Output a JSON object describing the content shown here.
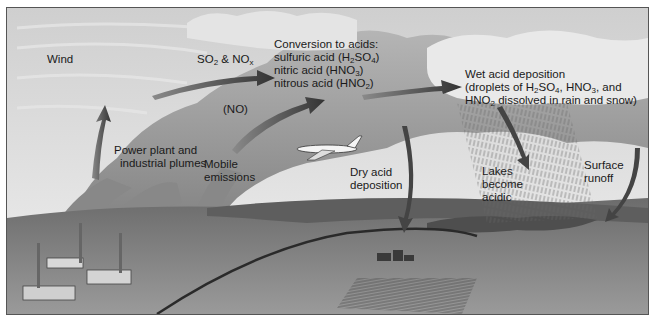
{
  "diagram": {
    "title": "Acid deposition",
    "colors": {
      "sky": "#d9d9d9",
      "cloud_light": "#e8e8e8",
      "cloud_dark": "#8a8a8a",
      "ground": "#7a7a7a",
      "arrow": "#444444",
      "text": "#1a1a1a"
    },
    "labels": {
      "wind": "Wind",
      "so2_nox": {
        "a": "SO",
        "a_sub": "2",
        "b": " & NO",
        "b_sub": "x"
      },
      "conversion": {
        "title": "Conversion to acids:",
        "line1": {
          "pre": "sulfuric acid (H",
          "s1": "2",
          "mid": "SO",
          "s2": "4",
          "post": ")"
        },
        "line2": {
          "pre": "nitric acid (HNO",
          "s1": "3",
          "post": ")"
        },
        "line3": {
          "pre": "nitrous acid (HNO",
          "s1": "2",
          "post": ")"
        }
      },
      "wet": {
        "title": "Wet acid deposition",
        "line1": {
          "pre": "(droplets of H",
          "s1": "2",
          "mid": "SO",
          "s2": "4",
          "mid2": ", HNO",
          "s3": "3",
          "post": ", and"
        },
        "line2": {
          "pre": "HNO",
          "s1": "2",
          "post": " dissolved in rain and snow)"
        }
      },
      "no": "(NO)",
      "power_plant": {
        "line1": "Power plant and",
        "line2": "industrial plumes"
      },
      "mobile": {
        "line1": "Mobile",
        "line2": "emissions"
      },
      "dry": {
        "line1": "Dry acid",
        "line2": "deposition"
      },
      "lakes": {
        "line1": "Lakes",
        "line2": "become",
        "line3": "acidic"
      },
      "runoff": {
        "line1": "Surface",
        "line2": "runoff"
      }
    }
  }
}
